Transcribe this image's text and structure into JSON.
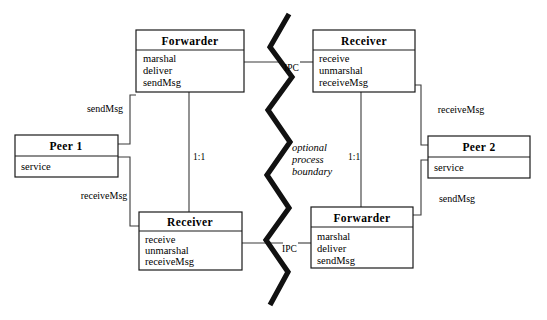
{
  "diagram": {
    "colors": {
      "box_stroke": "#1a1a1a",
      "connector": "#3a3a3a",
      "boundary": "#111111",
      "background": "#ffffff"
    },
    "boxes": [
      {
        "id": "forwarder-top",
        "title": "Forwarder",
        "operations": [
          "marshal",
          "deliver",
          "sendMsg"
        ],
        "x": 136,
        "y": 30,
        "w": 108,
        "h": 62,
        "header_h": 20
      },
      {
        "id": "receiver-top",
        "title": "Receiver",
        "operations": [
          "receive",
          "unmarshal",
          "receiveMsg"
        ],
        "x": 313,
        "y": 30,
        "w": 102,
        "h": 62,
        "header_h": 20
      },
      {
        "id": "peer-1",
        "title": "Peer 1",
        "operations": [
          "service"
        ],
        "x": 15,
        "y": 135,
        "w": 103,
        "h": 42,
        "header_h": 21
      },
      {
        "id": "peer-2",
        "title": "Peer 2",
        "operations": [
          "service"
        ],
        "x": 428,
        "y": 136,
        "w": 102,
        "h": 42,
        "header_h": 21
      },
      {
        "id": "receiver-bottom",
        "title": "Receiver",
        "operations": [
          "receive",
          "unmarshal",
          "receiveMsg"
        ],
        "x": 139,
        "y": 212,
        "w": 103,
        "h": 58,
        "header_h": 19
      },
      {
        "id": "forwarder-bottom",
        "title": "Forwarder",
        "operations": [
          "marshal",
          "deliver",
          "sendMsg"
        ],
        "x": 311,
        "y": 207,
        "w": 102,
        "h": 61,
        "header_h": 20
      }
    ],
    "labels": {
      "send_msg_left": "sendMsg",
      "receive_msg_left": "receiveMsg",
      "receive_msg_right": "receiveMsg",
      "send_msg_right": "sendMsg",
      "multiplicity_left": "1:1",
      "multiplicity_right": "1:1",
      "ipc_top": "IPC",
      "ipc_bottom": "IPC",
      "boundary_line_1": "optional",
      "boundary_line_2": "process",
      "boundary_line_3": "boundary"
    }
  }
}
